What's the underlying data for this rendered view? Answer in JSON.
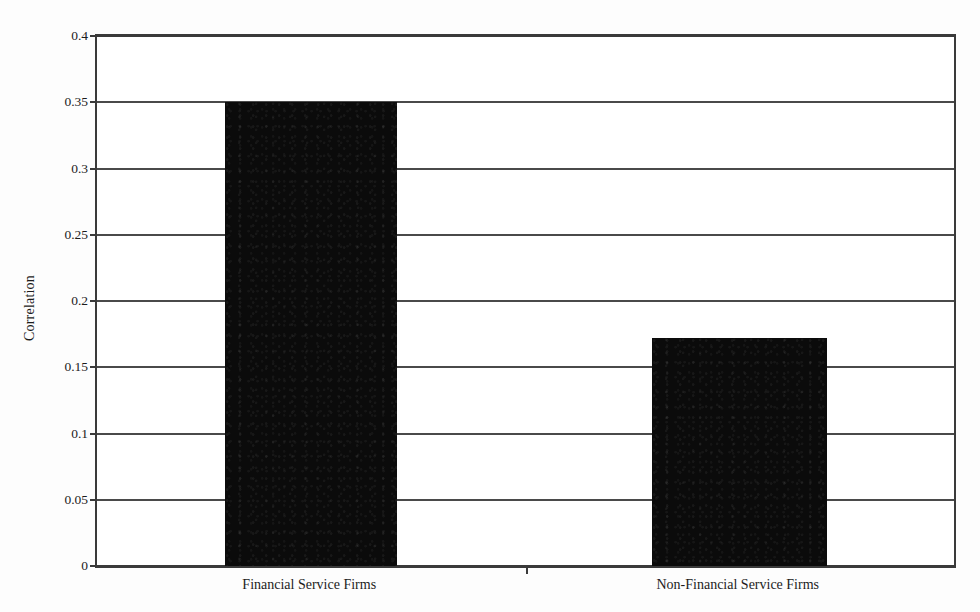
{
  "chart_data": {
    "type": "bar",
    "title": "",
    "xlabel": "",
    "ylabel": "Correlation",
    "categories": [
      "Financial Service Firms",
      "Non-Financial Service Firms"
    ],
    "values": [
      0.35,
      0.172
    ],
    "ylim": [
      0,
      0.4
    ],
    "ytick_step": 0.05,
    "yticks": [
      0,
      0.05,
      0.1,
      0.15,
      0.2,
      0.25,
      0.3,
      0.35,
      0.4
    ],
    "ytick_labels": [
      "0",
      "0.05",
      "0.1",
      "0.15",
      "0.2",
      "0.25",
      "0.3",
      "0.35",
      "0.4"
    ],
    "grid": true,
    "grid_axis": "y",
    "legend": false,
    "legend_position": "none",
    "bar_color": "#0b0b0b",
    "axis_color": "#3a3a3a",
    "grid_color": "#4a4a4a",
    "background_color": "#ffffff"
  },
  "axis": {
    "y_title": "Correlation"
  }
}
